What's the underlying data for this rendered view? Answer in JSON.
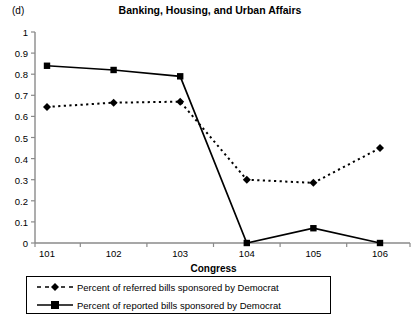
{
  "panel": {
    "letter": "(d)"
  },
  "chart_data": {
    "type": "line",
    "title": "Banking, Housing, and Urban Affairs",
    "xlabel": "Congress",
    "ylabel": "",
    "categories": [
      "101",
      "102",
      "103",
      "104",
      "105",
      "106"
    ],
    "x": [
      101,
      102,
      103,
      104,
      105,
      106
    ],
    "ylim": [
      0,
      1
    ],
    "yticks": [
      "0",
      "0.1",
      "0.2",
      "0.3",
      "0.4",
      "0.5",
      "0.6",
      "0.7",
      "0.8",
      "0.9",
      "1"
    ],
    "ytick_values": [
      0,
      0.1,
      0.2,
      0.3,
      0.4,
      0.5,
      0.6,
      0.7,
      0.8,
      0.9,
      1
    ],
    "grid": false,
    "legend_position": "bottom",
    "series": [
      {
        "name": "Percent of referred bills sponsored by Democrat",
        "values": [
          0.645,
          0.665,
          0.67,
          0.3,
          0.285,
          0.45
        ],
        "style": "dashed",
        "marker": "diamond",
        "color": "#000000"
      },
      {
        "name": "Percent of reported bills sponsored by Democrat",
        "values": [
          0.84,
          0.82,
          0.79,
          0.0,
          0.07,
          0.0
        ],
        "style": "solid",
        "marker": "square",
        "color": "#000000"
      }
    ]
  },
  "legend": {
    "items": [
      {
        "label": "Percent of referred bills sponsored by Democrat",
        "style": "dashed",
        "marker": "diamond"
      },
      {
        "label": "Percent of reported bills sponsored by Democrat",
        "style": "solid",
        "marker": "square"
      }
    ]
  },
  "colors": {
    "axis": "#8a8a8a",
    "line": "#000000",
    "background": "#ffffff"
  }
}
